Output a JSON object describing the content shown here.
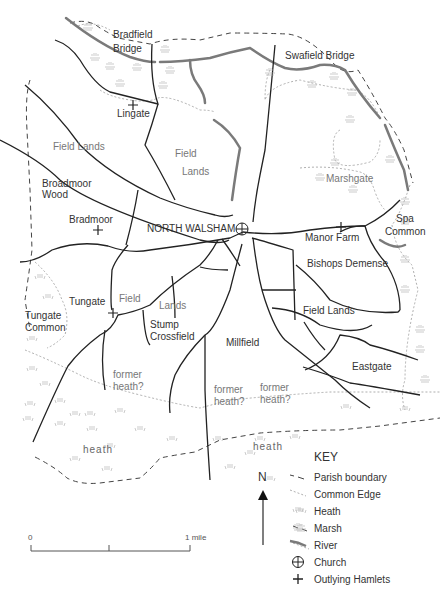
{
  "map": {
    "labels": {
      "bradfield_bridge": "Bradfield\nBridge",
      "bradfield_line1": "Bradfield",
      "bradfield_line2": "Bridge",
      "swafield_bridge": "Swafield Bridge",
      "lingate": "Lingate",
      "field_lands_west": "Field Lands",
      "field_center_1": "Field",
      "field_center_2": "Lands",
      "broadmoor_1": "Broadmoor",
      "broadmoor_2": "Wood",
      "marshgate": "Marshgate",
      "bradmoor": "Bradmoor",
      "north_walsham": "NORTH WALSHAM",
      "manor_farm": "Manor Farm",
      "spa_1": "Spa",
      "spa_2": "Common",
      "bishops_demense": "Bishops Demense",
      "tungate": "Tungate",
      "field_sw": "Field",
      "lands_sw": "Lands",
      "tungate_common_1": "Tungate",
      "tungate_common_2": "Common",
      "stump_1": "Stump",
      "stump_2": "Crossfield",
      "field_lands_east": "Field Lands",
      "millfield": "Millfield",
      "eastgate": "Eastgate",
      "former_heath_1a": "former",
      "former_heath_1b": "heath?",
      "former_heath_2a": "former",
      "former_heath_2b": "heath?",
      "former_heath_3a": "former",
      "former_heath_3b": "heath?",
      "heath_west": "heath",
      "heath_east": "heath"
    },
    "north_arrow": {
      "label": "N"
    },
    "scale_bar": {
      "start_label": "0",
      "end_label": "1 mile"
    },
    "key": {
      "title": "KEY",
      "items": [
        {
          "symbol": "dashed-dark-line",
          "label": "Parish boundary"
        },
        {
          "symbol": "dotted-grey-line",
          "label": "Common Edge"
        },
        {
          "symbol": "heath-tufts",
          "label": "Heath"
        },
        {
          "symbol": "marsh-tufts",
          "label": "Marsh"
        },
        {
          "symbol": "thick-grey-line",
          "label": "River"
        },
        {
          "symbol": "circle-cross",
          "label": "Church"
        },
        {
          "symbol": "plus",
          "label": "Outlying Hamlets"
        }
      ]
    },
    "colors": {
      "road": "#222222",
      "river": "#7a7a7a",
      "parish_boundary": "#444444",
      "common_edge": "#9a9a9a",
      "heath_marsh_symbol": "#b5b5b5",
      "label_dark": "#333333",
      "label_grey": "#777777"
    }
  }
}
